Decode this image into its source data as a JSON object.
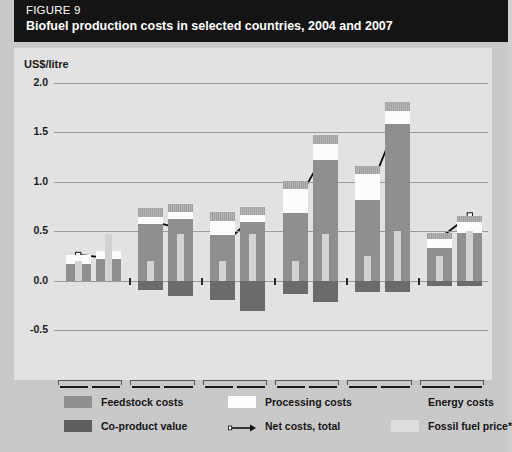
{
  "header": {
    "figure_label": "FIGURE 9",
    "title": "Biofuel production costs in selected countries, 2004 and 2007"
  },
  "axis": {
    "y_title": "US$/litre",
    "y_ticks": [
      "2.0",
      "1.5",
      "1.0",
      "0.5",
      "0.0",
      "-0.5"
    ]
  },
  "legend": {
    "feedstock": "Feedstock costs",
    "coproduct": "Co-product value",
    "processing": "Processing costs",
    "net": "Net costs, total",
    "energy": "Energy costs",
    "fossil": "Fossil fuel price*"
  },
  "groups": [
    {
      "years": [
        "2004",
        "2007"
      ],
      "line1_a": "Ethanol",
      "line1_b": "Sugar cane",
      "line2": "Brazil",
      "line3": ""
    },
    {
      "years": [
        "2004",
        "2007"
      ],
      "line1_a": "Ethanol",
      "line1_b": "Sugar beet",
      "line2": "European Union",
      "line3": ""
    },
    {
      "years": [
        "2004",
        "2007"
      ],
      "line1_a": "Ethanol",
      "line1_b": "Maize",
      "line2": "United States",
      "line3": "of America"
    },
    {
      "years": [
        "2004",
        "2007"
      ],
      "line1_a": "Ethanol",
      "line1_b": "Wheat",
      "line2": "European Union",
      "line3": ""
    },
    {
      "years": [
        "2004",
        "2007"
      ],
      "line1_a": "Biodiesel",
      "line1_b": "Rapeseed",
      "line2": "European Union",
      "line3": ""
    },
    {
      "years": [
        "2004",
        "2007"
      ],
      "line1_a": "Biodiesel",
      "line1_b": "Soybean",
      "line2": "Brazil",
      "line3": ""
    }
  ],
  "chart_data": {
    "type": "bar",
    "title": "Biofuel production costs in selected countries, 2004 and 2007",
    "xlabel": "",
    "ylabel": "US$/litre",
    "ylim": [
      -0.5,
      2.0
    ],
    "yticks": [
      -0.5,
      0.0,
      0.5,
      1.0,
      1.5,
      2.0
    ],
    "grid": true,
    "legend_position": "below-axes",
    "stacked": true,
    "categories": [
      "Ethanol • Sugar cane, Brazil 2004",
      "Ethanol • Sugar cane, Brazil 2007",
      "Ethanol • Sugar beet, European Union 2004",
      "Ethanol • Sugar beet, European Union 2007",
      "Ethanol • Maize, United States of America 2004",
      "Ethanol • Maize, United States of America 2007",
      "Ethanol • Wheat, European Union 2004",
      "Ethanol • Wheat, European Union 2007",
      "Biodiesel • Rapeseed, European Union 2004",
      "Biodiesel • Rapeseed, European Union 2007",
      "Biodiesel • Soybean, Brazil 2004",
      "Biodiesel • Soybean, Brazil 2007"
    ],
    "series": [
      {
        "name": "Feedstock costs",
        "color": "#8f8f8f",
        "values": [
          0.17,
          0.22,
          0.57,
          0.62,
          0.46,
          0.59,
          0.68,
          1.22,
          0.82,
          1.58,
          0.33,
          0.48
        ]
      },
      {
        "name": "Processing costs",
        "color": "#fcfcfc",
        "values": [
          0.09,
          0.08,
          0.07,
          0.07,
          0.14,
          0.07,
          0.25,
          0.16,
          0.26,
          0.14,
          0.09,
          0.11
        ]
      },
      {
        "name": "Energy costs",
        "color": "#a8a8a8",
        "values": [
          0.0,
          0.0,
          0.09,
          0.09,
          0.09,
          0.09,
          0.08,
          0.09,
          0.08,
          0.09,
          0.06,
          0.06
        ]
      },
      {
        "name": "Co-product value",
        "color": "#6b6b6b",
        "values": [
          0.0,
          0.0,
          -0.1,
          -0.16,
          -0.2,
          -0.31,
          -0.14,
          -0.22,
          -0.12,
          -0.12,
          -0.05,
          -0.05
        ]
      }
    ],
    "net_costs_total": {
      "name": "Net costs, total",
      "values": [
        0.26,
        0.23,
        0.6,
        0.53,
        0.36,
        0.64,
        0.76,
        1.3,
        0.86,
        1.61,
        0.43,
        0.66
      ]
    },
    "fossil_fuel_price": {
      "name": "Fossil fuel price*",
      "color": "#d2d2d2",
      "values": [
        0.2,
        0.47,
        0.2,
        0.47,
        0.2,
        0.47,
        0.2,
        0.47,
        0.25,
        0.5,
        0.25,
        0.5
      ]
    }
  }
}
